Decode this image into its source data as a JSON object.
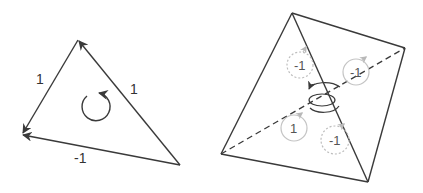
{
  "colors": {
    "stroke": "#3a3a3a",
    "faint": "#b8b8b8",
    "background": "#ffffff"
  },
  "left_diagram": {
    "name": "oriented-triangle",
    "vertices": {
      "top": [
        78,
        40
      ],
      "left": [
        22,
        134
      ],
      "right": [
        180,
        165
      ]
    },
    "edges": [
      {
        "from": "top",
        "to": "left",
        "label": "1"
      },
      {
        "from": "right",
        "to": "top",
        "label": "1"
      },
      {
        "from": "right",
        "to": "left",
        "label": "-1"
      }
    ],
    "orientation": "counterclockwise"
  },
  "right_diagram": {
    "name": "oriented-tetrahedron",
    "vertices": {
      "top": [
        292,
        13
      ],
      "right": [
        405,
        48
      ],
      "left": [
        221,
        154
      ],
      "bottom": [
        368,
        182
      ]
    },
    "face_labels": [
      {
        "label": "-1",
        "position": "upper-left",
        "style": "dashed"
      },
      {
        "label": "-1",
        "position": "upper-right",
        "style": "solid"
      },
      {
        "label": "1",
        "position": "lower-left",
        "style": "solid"
      },
      {
        "label": "-1",
        "position": "lower-center",
        "style": "dashed"
      }
    ],
    "center_symbol": "spiral-orientation"
  }
}
